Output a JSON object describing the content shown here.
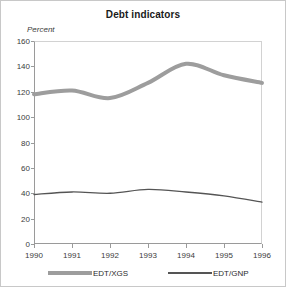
{
  "figure": {
    "title": "Debt indicators"
  },
  "chart_data": {
    "type": "line",
    "title": "Debt indicators",
    "xlabel": "",
    "ylabel": "Percent",
    "x": [
      1990,
      1991,
      1992,
      1993,
      1994,
      1995,
      1996
    ],
    "xtick_labels": [
      "1990",
      "1991",
      "1992",
      "1993",
      "1994",
      "1995",
      "1996"
    ],
    "ytick_labels": [
      "0",
      "20",
      "40",
      "60",
      "80",
      "100",
      "120",
      "140",
      "160"
    ],
    "ytick_values": [
      0,
      20,
      40,
      60,
      80,
      100,
      120,
      140,
      160
    ],
    "xlim": [
      1990,
      1996
    ],
    "ylim": [
      0,
      160
    ],
    "grid": false,
    "legend_position": "below-axis",
    "series": [
      {
        "name": "EDT/XGS",
        "color": "#9d9d9d",
        "line_width": "thick",
        "values": [
          118,
          121,
          115,
          127,
          142,
          133,
          127
        ]
      },
      {
        "name": "EDT/GNP",
        "color": "#555555",
        "line_width": "thin",
        "values": [
          39,
          41,
          40,
          43,
          41,
          38,
          33
        ]
      }
    ]
  },
  "legend": {
    "items": [
      {
        "label": "EDT/XGS",
        "style": "thick"
      },
      {
        "label": "EDT/GNP",
        "style": "thin"
      }
    ]
  }
}
